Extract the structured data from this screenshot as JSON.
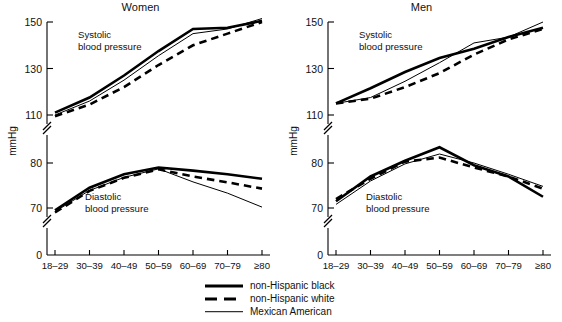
{
  "figure": {
    "y_axis_label": "mmHg",
    "x_axis_label": "Age (years)",
    "categories": [
      "18–29",
      "30–39",
      "40–49",
      "50–59",
      "60–69",
      "70–79",
      "≥80"
    ],
    "upper_ticks": [
      "150",
      "130",
      "110"
    ],
    "lower_ticks": [
      "80",
      "70"
    ],
    "zero_tick": "0",
    "annotation_systolic_line1": "Systolic",
    "annotation_systolic_line2": "blood pressure",
    "annotation_diastolic_line1": "Diastolic",
    "annotation_diastolic_line2": "blood pressure"
  },
  "legend": {
    "items": [
      {
        "label": "non-Hispanic black",
        "style": "solid-thick",
        "color": "#000000"
      },
      {
        "label": "non-Hispanic white",
        "style": "dashed-thick",
        "color": "#000000"
      },
      {
        "label": "Mexican American",
        "style": "solid-thin",
        "color": "#000000"
      }
    ]
  },
  "chart_data": [
    {
      "type": "line",
      "title": "Women",
      "xlabel": "Age (years)",
      "ylabel": "mmHg",
      "categories": [
        "18–29",
        "30–39",
        "40–49",
        "50–59",
        "60–69",
        "70–79",
        "≥80"
      ],
      "grid": false,
      "legend_position": "bottom-center",
      "axis_breaks": [
        [
          82,
          108
        ],
        [
          2,
          66
        ]
      ],
      "upper_ylim": [
        108,
        152
      ],
      "lower_ylim": [
        66,
        84
      ],
      "upper_yticks": [
        110,
        130,
        150
      ],
      "lower_yticks": [
        70,
        80
      ],
      "panels": [
        {
          "name": "Systolic blood pressure",
          "series": [
            {
              "name": "non-Hispanic black",
              "values": [
                111.0,
                117.5,
                127.0,
                137.5,
                147.0,
                147.5,
                150.5
              ]
            },
            {
              "name": "non-Hispanic white",
              "values": [
                109.5,
                114.5,
                122.0,
                131.5,
                140.0,
                145.0,
                150.0
              ]
            },
            {
              "name": "Mexican American",
              "values": [
                110.0,
                116.0,
                125.0,
                135.5,
                145.0,
                147.0,
                151.5
              ]
            }
          ]
        },
        {
          "name": "Diastolic blood pressure",
          "series": [
            {
              "name": "non-Hispanic black",
              "values": [
                69.5,
                74.5,
                77.5,
                79.0,
                78.3,
                77.5,
                76.5
              ]
            },
            {
              "name": "non-Hispanic white",
              "values": [
                69.0,
                73.8,
                76.7,
                78.6,
                77.0,
                75.7,
                74.3
              ]
            },
            {
              "name": "Mexican American",
              "values": [
                69.2,
                73.9,
                76.8,
                78.7,
                75.8,
                73.3,
                70.2
              ]
            }
          ]
        }
      ]
    },
    {
      "type": "line",
      "title": "Men",
      "xlabel": "Age (years)",
      "ylabel": "mmHg",
      "categories": [
        "18–29",
        "30–39",
        "40–49",
        "50–59",
        "60–69",
        "70–79",
        "≥80"
      ],
      "grid": false,
      "legend_position": "bottom-center",
      "axis_breaks": [
        [
          82,
          108
        ],
        [
          2,
          66
        ]
      ],
      "upper_ylim": [
        108,
        152
      ],
      "lower_ylim": [
        66,
        84
      ],
      "upper_yticks": [
        110,
        130,
        150
      ],
      "lower_yticks": [
        70,
        80
      ],
      "panels": [
        {
          "name": "Systolic blood pressure",
          "series": [
            {
              "name": "non-Hispanic black",
              "values": [
                115.0,
                121.5,
                128.5,
                134.5,
                138.5,
                143.5,
                147.5
              ]
            },
            {
              "name": "non-Hispanic white",
              "values": [
                115.0,
                117.0,
                122.0,
                128.0,
                136.0,
                142.5,
                147.0
              ]
            },
            {
              "name": "Mexican American",
              "values": [
                115.0,
                117.5,
                124.5,
                132.5,
                141.0,
                143.5,
                150.0
              ]
            }
          ]
        },
        {
          "name": "Diastolic blood pressure",
          "series": [
            {
              "name": "non-Hispanic black",
              "values": [
                71.5,
                77.0,
                80.5,
                83.5,
                79.5,
                77.0,
                72.5
              ]
            },
            {
              "name": "non-Hispanic white",
              "values": [
                72.0,
                76.5,
                80.3,
                81.2,
                79.0,
                77.0,
                74.3
              ]
            },
            {
              "name": "Mexican American",
              "values": [
                70.8,
                76.0,
                79.8,
                82.0,
                80.0,
                77.5,
                74.8
              ]
            }
          ]
        }
      ]
    }
  ]
}
